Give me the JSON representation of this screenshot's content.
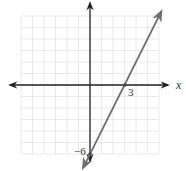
{
  "chart_data": {
    "type": "line",
    "title": "",
    "xlabel": "x",
    "ylabel": "",
    "xlim": [
      -6,
      6
    ],
    "ylim": [
      -6,
      6
    ],
    "grid": true,
    "annotations": [
      {
        "text": "3",
        "x": 3,
        "y": 0,
        "meaning": "x-intercept"
      },
      {
        "text": "−6",
        "x": 0,
        "y": -6,
        "meaning": "y-intercept"
      }
    ],
    "series": [
      {
        "name": "line",
        "equation": "y = 2x - 6",
        "x": [
          -0.6,
          6.2
        ],
        "y": [
          -7.2,
          6.4
        ],
        "color": "#6e6e6e"
      }
    ],
    "points": [
      {
        "x": 3,
        "y": 0
      },
      {
        "x": 0,
        "y": -6
      }
    ]
  },
  "labels": {
    "x_axis": "x",
    "x_intercept": "3",
    "y_intercept": "−6"
  },
  "colors": {
    "grid": "#e4e4e4",
    "axis": "#222222",
    "line": "#6e6e6e"
  }
}
